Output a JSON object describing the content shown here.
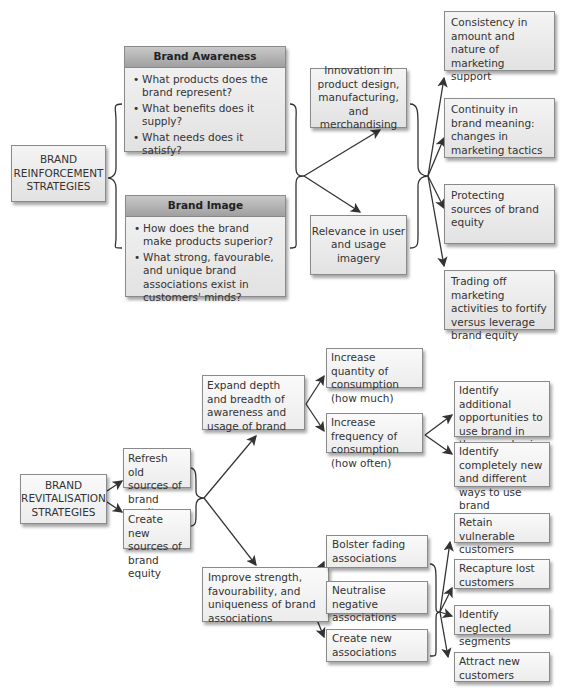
{
  "reinforcement": {
    "root": "BRAND\nREINFORCEMENT\nSTRATEGIES",
    "awareness": {
      "title": "Brand Awareness",
      "items": [
        "What products does the brand represent?",
        "What benefits does it supply?",
        "What needs does it satisfy?"
      ]
    },
    "image": {
      "title": "Brand Image",
      "items": [
        "How does the brand make products superior?",
        "What strong, favourable, and unique brand associations exist in customers' minds?"
      ]
    },
    "middle": [
      "Innovation in product design, manufacturing, and merchandising",
      "Relevance in user and usage imagery"
    ],
    "outcomes": [
      "Consistency in amount and nature of marketing support",
      "Continuity in brand meaning: changes in marketing tactics",
      "Protecting sources of brand equity",
      "Trading off marketing activities to fortify versus leverage brand equity"
    ]
  },
  "revitalisation": {
    "root": "BRAND\nREVITALISATION\nSTRATEGIES",
    "sources": [
      "Refresh old sources of brand equity",
      "Create new sources of brand equity"
    ],
    "expand": "Expand depth and breadth of awareness and usage of brand",
    "consumption": [
      "Increase quantity of consumption (how much)",
      "Increase frequency of consumption (how often)"
    ],
    "frequency_outcomes": [
      "Identify additional opportunities to use brand in the same basic way",
      "Identify completely new and different ways to use brand"
    ],
    "improve": "Improve strength, favourability, and uniqueness of brand associations",
    "associations": [
      "Bolster fading associations",
      "Neutralise negative associations",
      "Create new associations"
    ],
    "customers": [
      "Retain vulnerable customers",
      "Recapture lost customers",
      "Identify neglected segments",
      "Attract new customers"
    ]
  },
  "colors": {
    "box_border": "#8a8a8a",
    "header_fill": "#a8a8a8",
    "arrow": "#333333"
  }
}
